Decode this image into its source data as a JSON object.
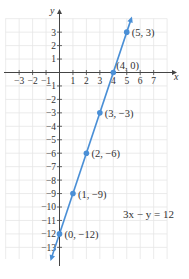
{
  "chart_data": {
    "type": "line",
    "title": "",
    "xlabel": "x",
    "ylabel": "y",
    "equation": "3x − y = 12",
    "xlim": [
      -4,
      8
    ],
    "ylim": [
      -14,
      4
    ],
    "grid": true,
    "x_ticks": [
      -3,
      -2,
      -1,
      1,
      2,
      3,
      4,
      5,
      6,
      7
    ],
    "y_ticks": [
      3,
      2,
      1,
      -1,
      -2,
      -3,
      -4,
      -5,
      -6,
      -7,
      -8,
      -9,
      -10,
      -11,
      -12,
      -13
    ],
    "series": [
      {
        "name": "3x − y = 12",
        "color": "#4a8fd6",
        "line": {
          "slope": 3,
          "intercept": -12
        },
        "points": [
          {
            "x": 5,
            "y": 3,
            "label": "(5, 3)"
          },
          {
            "x": 4,
            "y": 0,
            "label": "(4, 0)"
          },
          {
            "x": 3,
            "y": -3,
            "label": "(3, −3)"
          },
          {
            "x": 2,
            "y": -6,
            "label": "(2, −6)"
          },
          {
            "x": 1,
            "y": -9,
            "label": "(1, −9)"
          },
          {
            "x": 0,
            "y": -12,
            "label": "(0, −12)"
          }
        ]
      }
    ]
  },
  "labels": {
    "x_axis": "x",
    "y_axis": "y",
    "equation": "3x − y = 12"
  }
}
